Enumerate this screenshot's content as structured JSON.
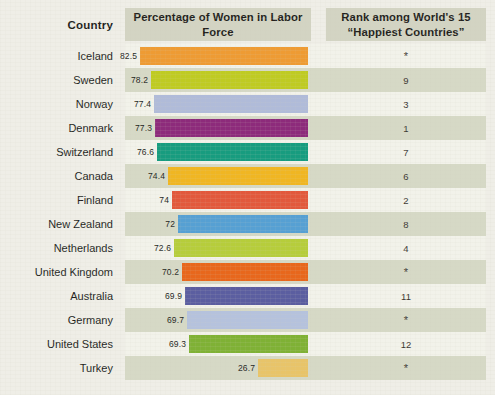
{
  "header": {
    "country_label": "Country",
    "percentage_label": "Percentage of Women in Labor Force",
    "rank_label": "Rank among World's 15 “Happiest Countries”"
  },
  "colors": {
    "page_background": "#EFEEE7",
    "header_band": "#D3D4C3",
    "stripe_light": "#F2F2EA",
    "stripe_dark": "#D6D9C6",
    "text": "#231f1c"
  },
  "chart_data": {
    "type": "bar",
    "title": "Percentage of Women in Labor Force",
    "xlabel": "",
    "ylabel": "Country",
    "orientation": "horizontal",
    "grid": false,
    "legend": false,
    "bars_right_aligned": true,
    "xlim": [
      0,
      82.5
    ],
    "categories": [
      "Iceland",
      "Sweden",
      "Norway",
      "Denmark",
      "Switzerland",
      "Canada",
      "Finland",
      "New Zealand",
      "Netherlands",
      "United Kingdom",
      "Australia",
      "Germany",
      "United States",
      "Turkey"
    ],
    "values": [
      82.5,
      78.2,
      77.4,
      77.3,
      76.6,
      74.4,
      74,
      72,
      72.6,
      70.2,
      69.9,
      69.7,
      69.3,
      26.7
    ],
    "value_labels": [
      "82.5",
      "78.2",
      "77.4",
      "77.3",
      "76.6",
      "74.4",
      "74",
      "72",
      "72.6",
      "70.2",
      "69.9",
      "69.7",
      "69.3",
      "26.7"
    ],
    "bar_colors": [
      "#EE9B33",
      "#BFCB22",
      "#B0BBD9",
      "#8D2B7B",
      "#179C7F",
      "#F0B622",
      "#E2593C",
      "#56A0D3",
      "#B6CD3B",
      "#E8671C",
      "#5B5EA0",
      "#B5C2DD",
      "#7FB135",
      "#E8C469"
    ],
    "rank_column": {
      "title": "Rank among World's 15 “Happiest Countries”",
      "values": [
        "*",
        "9",
        "3",
        "1",
        "7",
        "6",
        "2",
        "8",
        "4",
        "*",
        "11",
        "*",
        "12",
        "*"
      ]
    }
  },
  "rows": [
    {
      "country": "Iceland",
      "value": 82.5,
      "value_label": "82.5",
      "color": "#EE9B33",
      "rank": "*",
      "bar_px": 168
    },
    {
      "country": "Sweden",
      "value": 78.2,
      "value_label": "78.2",
      "color": "#BFCB22",
      "rank": "9",
      "bar_px": 157
    },
    {
      "country": "Norway",
      "value": 77.4,
      "value_label": "77.4",
      "color": "#B0BBD9",
      "rank": "3",
      "bar_px": 154
    },
    {
      "country": "Denmark",
      "value": 77.3,
      "value_label": "77.3",
      "color": "#8D2B7B",
      "rank": "1",
      "bar_px": 153
    },
    {
      "country": "Switzerland",
      "value": 76.6,
      "value_label": "76.6",
      "color": "#179C7F",
      "rank": "7",
      "bar_px": 151
    },
    {
      "country": "Canada",
      "value": 74.4,
      "value_label": "74.4",
      "color": "#F0B622",
      "rank": "6",
      "bar_px": 140
    },
    {
      "country": "Finland",
      "value": 74,
      "value_label": "74",
      "color": "#E2593C",
      "rank": "2",
      "bar_px": 136
    },
    {
      "country": "New Zealand",
      "value": 72,
      "value_label": "72",
      "color": "#56A0D3",
      "rank": "8",
      "bar_px": 130
    },
    {
      "country": "Netherlands",
      "value": 72.6,
      "value_label": "72.6",
      "color": "#B6CD3B",
      "rank": "4",
      "bar_px": 134
    },
    {
      "country": "United Kingdom",
      "value": 70.2,
      "value_label": "70.2",
      "color": "#E8671C",
      "rank": "*",
      "bar_px": 126
    },
    {
      "country": "Australia",
      "value": 69.9,
      "value_label": "69.9",
      "color": "#5B5EA0",
      "rank": "11",
      "bar_px": 123
    },
    {
      "country": "Germany",
      "value": 69.7,
      "value_label": "69.7",
      "color": "#B5C2DD",
      "rank": "*",
      "bar_px": 121
    },
    {
      "country": "United States",
      "value": 69.3,
      "value_label": "69.3",
      "color": "#7FB135",
      "rank": "12",
      "bar_px": 119
    },
    {
      "country": "Turkey",
      "value": 26.7,
      "value_label": "26.7",
      "color": "#E8C469",
      "rank": "*",
      "bar_px": 50
    }
  ]
}
